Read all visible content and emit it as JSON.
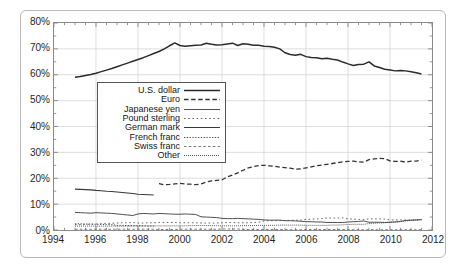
{
  "chart_data": {
    "type": "line",
    "title": "",
    "subtitle": "",
    "xlabel": "",
    "ylabel": "",
    "xlim": [
      1994,
      2012
    ],
    "ylim": [
      0,
      80
    ],
    "grid": true,
    "legend_position": "inside-upper-left",
    "x_ticks": [
      "1994",
      "1996",
      "1998",
      "2000",
      "2002",
      "2004",
      "2006",
      "2008",
      "2010",
      "2012"
    ],
    "y_ticks": [
      "0%",
      "10%",
      "20%",
      "30%",
      "40%",
      "50%",
      "60%",
      "70%",
      "80%"
    ],
    "y_tick_values": [
      0,
      10,
      20,
      30,
      40,
      50,
      60,
      70,
      80
    ],
    "x_tick_values": [
      1994,
      1996,
      1998,
      2000,
      2002,
      2004,
      2006,
      2008,
      2010,
      2012
    ],
    "x": [
      1995.0,
      1995.25,
      1995.5,
      1995.75,
      1996.0,
      1996.25,
      1996.5,
      1996.75,
      1997.0,
      1997.25,
      1997.5,
      1997.75,
      1998.0,
      1998.25,
      1998.5,
      1998.75,
      1999.0,
      1999.25,
      1999.5,
      1999.75,
      2000.0,
      2000.25,
      2000.5,
      2000.75,
      2001.0,
      2001.25,
      2001.5,
      2001.75,
      2002.0,
      2002.25,
      2002.5,
      2002.75,
      2003.0,
      2003.25,
      2003.5,
      2003.75,
      2004.0,
      2004.25,
      2004.5,
      2004.75,
      2005.0,
      2005.25,
      2005.5,
      2005.75,
      2006.0,
      2006.25,
      2006.5,
      2006.75,
      2007.0,
      2007.25,
      2007.5,
      2007.75,
      2008.0,
      2008.25,
      2008.5,
      2008.75,
      2009.0,
      2009.25,
      2009.5,
      2009.75,
      2010.0,
      2010.25,
      2010.5,
      2010.75,
      2011.0,
      2011.25,
      2011.5
    ],
    "series": [
      {
        "name": "U.S. dollar",
        "style": "solid-thick",
        "color": "#2b2b2b",
        "values": [
          59.0,
          59.3,
          59.7,
          60.1,
          60.6,
          61.2,
          61.8,
          62.4,
          63.1,
          63.8,
          64.5,
          65.2,
          65.9,
          66.6,
          67.4,
          68.2,
          69.0,
          70.0,
          71.2,
          72.3,
          71.3,
          71.0,
          71.2,
          71.4,
          71.5,
          72.2,
          71.8,
          71.5,
          71.6,
          71.9,
          72.2,
          71.3,
          72.0,
          71.8,
          71.4,
          71.4,
          71.0,
          70.9,
          70.6,
          70.0,
          68.5,
          67.8,
          67.5,
          67.9,
          67.0,
          66.7,
          66.6,
          66.2,
          66.4,
          66.0,
          65.7,
          64.9,
          64.2,
          63.6,
          64.0,
          64.1,
          65.0,
          63.4,
          62.8,
          62.1,
          61.8,
          61.5,
          61.6,
          61.5,
          61.2,
          60.8,
          60.3
        ]
      },
      {
        "name": "Euro",
        "style": "dashed",
        "color": "#333333",
        "values": [
          null,
          null,
          null,
          null,
          null,
          null,
          null,
          null,
          null,
          null,
          null,
          null,
          null,
          null,
          null,
          null,
          17.9,
          17.5,
          17.6,
          17.8,
          18.0,
          17.8,
          17.7,
          17.5,
          17.8,
          18.5,
          19.0,
          19.2,
          19.4,
          20.5,
          21.2,
          22.1,
          23.1,
          24.0,
          24.5,
          24.9,
          25.0,
          24.8,
          24.6,
          24.3,
          24.1,
          23.9,
          23.5,
          23.6,
          24.0,
          24.4,
          24.8,
          25.1,
          25.4,
          25.7,
          26.0,
          26.3,
          26.5,
          26.6,
          26.3,
          26.2,
          27.2,
          27.5,
          27.7,
          27.6,
          26.7,
          26.5,
          26.6,
          26.2,
          26.6,
          26.6,
          27.0
        ]
      },
      {
        "name": "Japanese yen",
        "style": "solid-thin",
        "color": "#3a3a3a",
        "values": [
          6.8,
          6.7,
          6.6,
          6.5,
          6.7,
          6.6,
          6.5,
          6.4,
          6.2,
          6.0,
          5.8,
          5.6,
          6.2,
          6.4,
          6.3,
          6.2,
          6.4,
          6.3,
          6.2,
          6.1,
          6.1,
          6.2,
          6.1,
          6.0,
          5.1,
          5.0,
          4.9,
          4.8,
          4.5,
          4.4,
          4.4,
          4.5,
          4.4,
          4.3,
          4.2,
          4.1,
          3.9,
          3.8,
          3.8,
          3.8,
          3.6,
          3.6,
          3.5,
          3.4,
          3.2,
          3.2,
          3.1,
          3.1,
          2.9,
          2.9,
          2.9,
          2.9,
          3.1,
          3.2,
          3.3,
          3.5,
          3.0,
          3.0,
          3.0,
          2.9,
          3.0,
          3.1,
          3.3,
          3.7,
          3.8,
          3.9,
          4.0
        ]
      },
      {
        "name": "Pound sterling",
        "style": "dotted-sparse",
        "color": "#555555",
        "values": [
          2.1,
          2.1,
          2.2,
          2.2,
          2.3,
          2.4,
          2.5,
          2.6,
          2.7,
          2.8,
          2.8,
          2.9,
          2.7,
          2.7,
          2.8,
          2.8,
          2.9,
          2.9,
          2.9,
          2.9,
          2.8,
          2.8,
          2.8,
          2.8,
          2.7,
          2.7,
          2.7,
          2.7,
          2.8,
          2.9,
          2.9,
          2.8,
          2.8,
          2.8,
          2.9,
          3.0,
          3.5,
          3.6,
          3.6,
          3.6,
          3.7,
          3.7,
          3.8,
          3.8,
          4.1,
          4.2,
          4.3,
          4.4,
          4.7,
          4.6,
          4.6,
          4.7,
          4.3,
          4.2,
          4.1,
          4.0,
          4.3,
          4.3,
          4.3,
          4.2,
          3.9,
          3.9,
          3.9,
          3.9,
          3.8,
          3.8,
          3.8
        ]
      },
      {
        "name": "German mark",
        "style": "solid-med",
        "color": "#3a3a3a",
        "values": [
          15.8,
          15.7,
          15.6,
          15.5,
          15.3,
          15.2,
          15.0,
          14.9,
          14.7,
          14.5,
          14.3,
          14.1,
          13.8,
          13.7,
          13.6,
          13.5,
          null,
          null,
          null,
          null,
          null,
          null,
          null,
          null,
          null,
          null,
          null,
          null,
          null,
          null,
          null,
          null,
          null,
          null,
          null,
          null,
          null,
          null,
          null,
          null,
          null,
          null,
          null,
          null,
          null,
          null,
          null,
          null,
          null,
          null,
          null,
          null,
          null,
          null,
          null,
          null,
          null,
          null,
          null,
          null,
          null,
          null,
          null,
          null,
          null,
          null,
          null
        ]
      },
      {
        "name": "French franc",
        "style": "dotted-dense",
        "color": "#4a4a4a",
        "values": [
          2.4,
          2.4,
          2.3,
          2.3,
          2.2,
          2.2,
          2.1,
          2.1,
          1.8,
          1.8,
          1.7,
          1.7,
          1.6,
          1.6,
          1.5,
          1.5,
          null,
          null,
          null,
          null,
          null,
          null,
          null,
          null,
          null,
          null,
          null,
          null,
          null,
          null,
          null,
          null,
          null,
          null,
          null,
          null,
          null,
          null,
          null,
          null,
          null,
          null,
          null,
          null,
          null,
          null,
          null,
          null,
          null,
          null,
          null,
          null,
          null,
          null,
          null,
          null,
          null,
          null,
          null,
          null,
          null,
          null,
          null,
          null,
          null,
          null,
          null
        ]
      },
      {
        "name": "Swiss franc",
        "style": "dashed-short",
        "color": "#6a6a6a",
        "values": [
          0.3,
          0.3,
          0.3,
          0.3,
          0.3,
          0.3,
          0.3,
          0.3,
          0.3,
          0.3,
          0.3,
          0.3,
          0.3,
          0.3,
          0.3,
          0.3,
          0.2,
          0.2,
          0.2,
          0.2,
          0.3,
          0.3,
          0.3,
          0.3,
          0.3,
          0.3,
          0.3,
          0.3,
          0.4,
          0.4,
          0.4,
          0.4,
          0.2,
          0.2,
          0.2,
          0.2,
          0.2,
          0.2,
          0.2,
          0.2,
          0.1,
          0.1,
          0.1,
          0.1,
          0.2,
          0.2,
          0.2,
          0.2,
          0.2,
          0.2,
          0.2,
          0.2,
          0.1,
          0.1,
          0.1,
          0.1,
          0.1,
          0.1,
          0.1,
          0.1,
          0.1,
          0.1,
          0.1,
          0.1,
          0.1,
          0.1,
          0.1
        ]
      },
      {
        "name": "Other",
        "style": "dotted-fine",
        "color": "#444444",
        "values": [
          1.5,
          1.5,
          1.5,
          1.5,
          1.5,
          1.5,
          1.5,
          1.5,
          1.5,
          1.5,
          1.5,
          1.5,
          1.6,
          1.6,
          1.6,
          1.6,
          1.6,
          1.6,
          1.6,
          1.6,
          1.6,
          1.6,
          1.7,
          1.7,
          1.7,
          1.7,
          1.7,
          1.7,
          1.6,
          1.6,
          1.6,
          1.6,
          1.7,
          1.7,
          1.7,
          1.8,
          1.8,
          1.8,
          1.8,
          1.9,
          1.9,
          1.9,
          1.9,
          1.9,
          1.8,
          1.8,
          1.8,
          1.8,
          1.8,
          1.9,
          1.9,
          2.0,
          2.1,
          2.2,
          2.2,
          2.2,
          2.5,
          2.6,
          2.7,
          2.8,
          3.0,
          3.1,
          3.3,
          3.5,
          3.7,
          3.9,
          4.1
        ]
      }
    ]
  },
  "legend": {
    "items": [
      {
        "label": "U.S. dollar"
      },
      {
        "label": "Euro"
      },
      {
        "label": "Japanese yen"
      },
      {
        "label": "Pound sterling"
      },
      {
        "label": "German mark"
      },
      {
        "label": "French franc"
      },
      {
        "label": "Swiss franc"
      },
      {
        "label": "Other"
      }
    ]
  }
}
